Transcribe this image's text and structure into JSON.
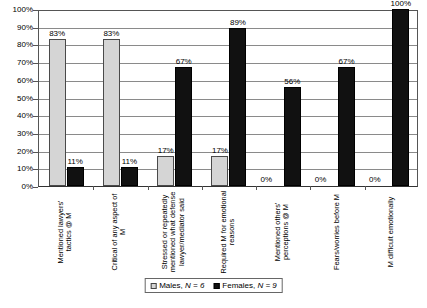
{
  "chart_data": {
    "type": "bar",
    "title": "",
    "xlabel": "",
    "ylabel": "",
    "ylim": [
      0,
      100
    ],
    "ytick_labels": [
      "100%",
      "90%",
      "80%",
      "70%",
      "60%",
      "50%",
      "40%",
      "30%",
      "20%",
      "10%",
      "0%"
    ],
    "ytick_values": [
      100,
      90,
      80,
      70,
      60,
      50,
      40,
      30,
      20,
      10,
      0
    ],
    "grid": true,
    "legend_position": "bottom-center",
    "categories": [
      "Mentioned lawyers' tactics @ M",
      "Critical of any aspect of M",
      "Stressed or repeatedly mentioned what defense lawyer/mediator said",
      "Required M for emotional reasons",
      "Mentioned others' perceptions @ M",
      "Fears/worries before M",
      "M difficult emotionally"
    ],
    "series": [
      {
        "name": "Males, N = 6",
        "color": "#d5d5d5",
        "values": [
          83,
          83,
          17,
          17,
          0,
          0,
          0
        ],
        "labels": [
          "83%",
          "83%",
          "17%",
          "17%",
          "0%",
          "0%",
          "0%"
        ]
      },
      {
        "name": "Females, N = 9",
        "color": "#111111",
        "values": [
          11,
          11,
          67,
          89,
          56,
          67,
          100
        ],
        "labels": [
          "11%",
          "11%",
          "67%",
          "89%",
          "56%",
          "67%",
          "100%"
        ]
      }
    ]
  },
  "legend": {
    "males_label": "Males, ",
    "males_n": "N = 6",
    "females_label": "Females, ",
    "females_n": "N = 9"
  }
}
